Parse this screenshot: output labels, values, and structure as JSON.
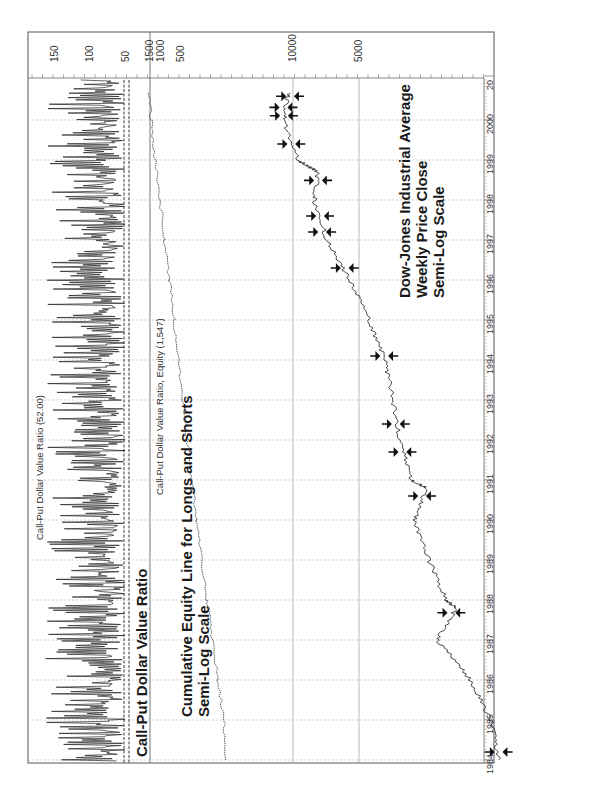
{
  "chart_data": [
    {
      "type": "line",
      "orientation": "rotated-90-ccw",
      "title": "Call-Put Dollar Value Ratio (52.00)",
      "annotation": "Call-Put Dollar Value Ratio",
      "xlabel": "",
      "ylabel": "",
      "x_ticks": [
        "1984",
        "1985",
        "1986",
        "1987",
        "1988",
        "1989",
        "1990",
        "1991",
        "1992",
        "1993",
        "1994",
        "1995",
        "1996",
        "1997",
        "1998",
        "1999",
        "2000",
        "20"
      ],
      "y_ticks": [
        150,
        100,
        50
      ],
      "ylim": [
        0,
        170
      ],
      "threshold_lines": [
        45,
        52
      ],
      "grid": true,
      "series": [
        {
          "name": "Call-Put Dollar Value Ratio",
          "x": [
            1984,
            1985,
            1986,
            1987,
            1988,
            1989,
            1990,
            1991,
            1992,
            1993,
            1994,
            1995,
            1996,
            1997,
            1998,
            1999,
            2000,
            2000.7
          ],
          "values": [
            45,
            90,
            110,
            100,
            95,
            115,
            90,
            100,
            95,
            105,
            90,
            95,
            110,
            100,
            115,
            110,
            105,
            95
          ]
        }
      ]
    },
    {
      "type": "line",
      "orientation": "rotated-90-ccw",
      "title": "Call-Put Dollar Value Ratio, Equity (1,547)",
      "annotation": "Cumulative Equity Line for Longs and Shorts\nSemi-Log Scale",
      "y_ticks": [
        1500,
        1000,
        500
      ],
      "scale": "log",
      "grid": true,
      "series": [
        {
          "name": "Equity",
          "x": [
            1984,
            1985,
            1986,
            1987,
            1988,
            1989,
            1990,
            1991,
            1992,
            1993,
            1994,
            1995,
            1996,
            1997,
            1998,
            1999,
            2000,
            2000.7
          ],
          "values": [
            100,
            110,
            135,
            165,
            200,
            240,
            290,
            340,
            400,
            470,
            540,
            640,
            760,
            900,
            1050,
            1250,
            1450,
            1547
          ]
        }
      ]
    },
    {
      "type": "line",
      "orientation": "rotated-90-ccw",
      "title": "Dow-Jones Industrial Average",
      "annotation": "Dow-Jones Industrial Average\nWeekly Price Close\nSemi-Log Scale",
      "y_ticks": [
        10000,
        5000
      ],
      "scale": "log",
      "grid": true,
      "series": [
        {
          "name": "DJIA Weekly Close",
          "x": [
            1984,
            1985,
            1986,
            1987,
            1987.8,
            1988,
            1989,
            1990,
            1990.8,
            1991,
            1992,
            1993,
            1994,
            1995,
            1996,
            1997,
            1998,
            1998.7,
            1999,
            2000,
            2000.7
          ],
          "values": [
            1150,
            1250,
            1550,
            2200,
            1800,
            2000,
            2400,
            2800,
            2450,
            2900,
            3250,
            3500,
            3800,
            4500,
            5500,
            7000,
            8000,
            7700,
            9500,
            11000,
            10500
          ]
        }
      ],
      "markers": "buy/sell arrows at signal points"
    }
  ],
  "labels": {
    "top_title": "Call-Put Dollar Value Ratio (52.00)",
    "equity_title": "Call-Put Dollar Value Ratio, Equity (1,547)",
    "cpdvr_annotation": "Call-Put Dollar Value Ratio",
    "equity_annotation_1": "Cumulative Equity Line for Longs and Shorts",
    "equity_annotation_2": "Semi-Log Scale",
    "djia_annotation_1": "Dow-Jones Industrial Average",
    "djia_annotation_2": "Weekly Price Close",
    "djia_annotation_3": "Semi-Log Scale"
  },
  "axis": {
    "years": [
      {
        "label": "20",
        "y": 68
      },
      {
        "label": "2000",
        "y": 112
      },
      {
        "label": "1999",
        "y": 152
      },
      {
        "label": "1998",
        "y": 192
      },
      {
        "label": "1997",
        "y": 232
      },
      {
        "label": "1996",
        "y": 272
      },
      {
        "label": "1995",
        "y": 312
      },
      {
        "label": "1994",
        "y": 352
      },
      {
        "label": "1993",
        "y": 392
      },
      {
        "label": "1992",
        "y": 432
      },
      {
        "label": "1991",
        "y": 472
      },
      {
        "label": "1990",
        "y": 512
      },
      {
        "label": "1989",
        "y": 552
      },
      {
        "label": "1988",
        "y": 592
      },
      {
        "label": "1987",
        "y": 632
      },
      {
        "label": "1986",
        "y": 672
      },
      {
        "label": "1985",
        "y": 712
      },
      {
        "label": "1984",
        "y": 752
      }
    ],
    "values": [
      {
        "label": "150",
        "x": 55
      },
      {
        "label": "100",
        "x": 90
      },
      {
        "label": "50",
        "x": 126
      },
      {
        "label": "1500",
        "x": 150
      },
      {
        "label": "1000",
        "x": 161
      },
      {
        "label": "500",
        "x": 181
      },
      {
        "label": "10000",
        "x": 293
      },
      {
        "label": "5000",
        "x": 359
      }
    ]
  }
}
